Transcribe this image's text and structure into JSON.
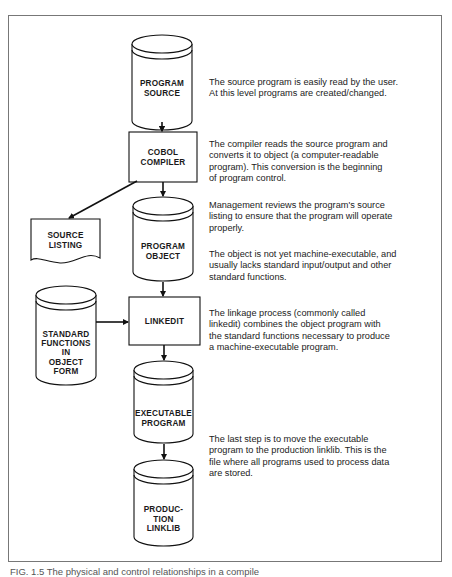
{
  "nodes": {
    "program_source": {
      "shape": "cylinder",
      "label": "PROGRAM\nSOURCE"
    },
    "cobol_compiler": {
      "shape": "box",
      "label": "COBOL\nCOMPILER"
    },
    "source_listing": {
      "shape": "document",
      "label": "SOURCE\nLISTING"
    },
    "program_object": {
      "shape": "cylinder",
      "label": "PROGRAM\nOBJECT"
    },
    "standard_functions": {
      "shape": "cylinder",
      "label": "STANDARD\nFUNCTIONS\nIN\nOBJECT\nFORM"
    },
    "linkedit": {
      "shape": "box",
      "label": "LINKEDIT"
    },
    "executable_program": {
      "shape": "cylinder",
      "label": "EXECUTABLE\nPROGRAM"
    },
    "production_linklib": {
      "shape": "cylinder",
      "label": "PRODUC-\nTION\nLINKLIB"
    }
  },
  "edges": [
    {
      "from": "program_source",
      "to": "cobol_compiler"
    },
    {
      "from": "cobol_compiler",
      "to": "program_object"
    },
    {
      "from": "cobol_compiler",
      "to": "source_listing"
    },
    {
      "from": "program_object",
      "to": "linkedit"
    },
    {
      "from": "standard_functions",
      "to": "linkedit"
    },
    {
      "from": "linkedit",
      "to": "executable_program"
    },
    {
      "from": "executable_program",
      "to": "production_linklib"
    }
  ],
  "descriptions": {
    "source": "The source program is easily read by the user.\nAt this level programs are created/changed.",
    "compiler": "The compiler reads the source program and\nconverts it to object (a computer-readable\nprogram). This conversion is the beginning\nof program control.",
    "review": "Management reviews the program's source\nlisting to ensure that the program will operate\nproperly.",
    "object": "The object is not yet machine-executable, and\nusually lacks standard input/output and other\nstandard functions.",
    "linkage": "The linkage process (commonly called\nlinkedit) combines the object program with\nthe standard functions necessary to produce\na machine-executable program.",
    "last_step": "The last step is to move the executable\nprogram to the production linklib. This is the\nfile where all programs used to process data\nare stored."
  },
  "caption": "FIG. 1.5  The physical and control relationships in a compile"
}
